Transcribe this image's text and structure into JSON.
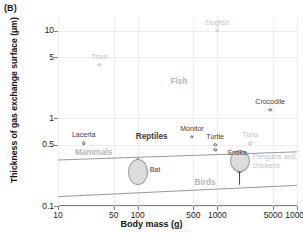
{
  "panel": {
    "letter": "(B)"
  },
  "axes": {
    "ylabel": "Thickness of gas exchange surface (μm)",
    "xlabel": "Body mass (g)",
    "yticks": [
      "0.1",
      "0.5",
      "1",
      "5",
      "10"
    ],
    "xticks": [
      "10",
      "50",
      "100",
      "500",
      "1000",
      "5000",
      "10000"
    ]
  },
  "chart_data": {
    "type": "scatter",
    "title": "",
    "xlabel": "Body mass (g)",
    "ylabel": "Thickness of gas exchange surface (μm)",
    "xscale": "log",
    "yscale": "log",
    "xlim": [
      10,
      10000
    ],
    "ylim": [
      0.1,
      14
    ],
    "xticks": [
      10,
      50,
      100,
      500,
      1000,
      5000,
      10000
    ],
    "yticks": [
      0.1,
      0.5,
      1,
      5,
      10
    ],
    "grid": true,
    "legend": "none",
    "points": [
      {
        "name": "Dogfish",
        "x": 1000,
        "y": 10.0,
        "tone": "light",
        "label_dx": 0,
        "label_dy": -8
      },
      {
        "name": "Trout",
        "x": 33,
        "y": 4.1,
        "tone": "light",
        "label_dx": 0,
        "label_dy": -8
      },
      {
        "name": "Crocodile",
        "x": 4600,
        "y": 1.25,
        "tone": "dark",
        "label_dx": 0,
        "label_dy": -8
      },
      {
        "name": "Lacerta",
        "x": 21,
        "y": 0.52,
        "tone": "dark",
        "label_dx": 0,
        "label_dy": -8
      },
      {
        "name": "Monitor",
        "x": 480,
        "y": 0.62,
        "tone": "dark",
        "label_dx": 0,
        "label_dy": -8
      },
      {
        "name": "Turtle",
        "x": 940,
        "y": 0.5,
        "tone": "dark",
        "label_dx": 0,
        "label_dy": -8
      },
      {
        "name": "Snake",
        "x": 940,
        "y": 0.44,
        "tone": "dark",
        "label_dx": 22,
        "label_dy": 3
      },
      {
        "name": "Tuna",
        "x": 2600,
        "y": 0.52,
        "tone": "light",
        "label_dx": 0,
        "label_dy": -8
      }
    ],
    "group_labels": [
      {
        "name": "Fish",
        "x": 330,
        "y": 2.6,
        "tone": "grey"
      },
      {
        "name": "Reptiles",
        "x": 150,
        "y": 0.62,
        "tone": "dark"
      },
      {
        "name": "Mammals",
        "x": 28,
        "y": 0.4,
        "tone": "grey"
      },
      {
        "name": "Birds",
        "x": 700,
        "y": 0.185,
        "tone": "grey"
      }
    ],
    "blobs": [
      {
        "name": "Bat",
        "x": 100,
        "y": 0.245,
        "rx": 10,
        "ry": 13,
        "label": "Bat",
        "tone": "dark",
        "label_dx": 12,
        "label_dy": -2,
        "arrow": {
          "from_y": 0.355,
          "to_y": 0.295,
          "dir": "down"
        }
      },
      {
        "name": "Penguins and chickens",
        "x": 1900,
        "y": 0.325,
        "rx": 10,
        "ry": 11,
        "label": "Penguins and chickens",
        "tone": "grey",
        "label_dx": 13,
        "label_dy": -4,
        "arrow": {
          "from_y": 0.175,
          "to_y": 0.268,
          "dir": "up"
        }
      }
    ],
    "trend_lines": [
      {
        "name": "mammals-bound",
        "points": [
          [
            10,
            0.335
          ],
          [
            10000,
            0.415
          ]
        ]
      },
      {
        "name": "birds-bound",
        "points": [
          [
            10,
            0.128
          ],
          [
            10000,
            0.172
          ]
        ]
      }
    ]
  }
}
